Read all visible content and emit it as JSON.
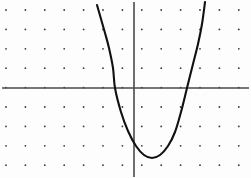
{
  "figure": {
    "background_color": "#fdfdfd",
    "width": 251,
    "height": 178
  },
  "grid": {
    "dot_color": "#3a3a3a",
    "dot_radius": 0.9,
    "spacing_px": 19.4,
    "origin_px": {
      "x": 134,
      "y": 88
    },
    "columns_px": [
      6,
      25.4,
      44.8,
      64.2,
      83.6,
      103,
      122.4,
      141.8,
      161.2,
      180.6,
      200,
      219.4,
      238.8
    ],
    "rows_px": [
      10,
      29.4,
      48.8,
      68.2,
      87.6,
      107,
      126.4,
      145.8,
      165.2
    ]
  },
  "axes": {
    "x_axis": {
      "label": "x-axis",
      "color": "#4a4a4a",
      "y_px": 88,
      "x_start_px": 2,
      "x_end_px": 249
    },
    "y_axis": {
      "label": "y-axis",
      "color": "#4a4a4a",
      "x_px": 134,
      "y_start_px": 2,
      "y_end_px": 177
    }
  },
  "chart_data": {
    "type": "line",
    "title": "",
    "xlabel": "",
    "ylabel": "",
    "curve_name": "parabola",
    "equation": "y = (x + 1)(x - 2.7)",
    "orientation": "opens upward",
    "stroke_color": "#111111",
    "grid_units": {
      "vertex": {
        "x": 0.93,
        "y": -3.6
      },
      "roots": [
        -0.98,
        2.73
      ],
      "leading_coefficient": 1.05,
      "xlim": [
        -6.8,
        6.0
      ],
      "ylim": [
        -4.6,
        4.5
      ]
    },
    "points_px": [
      {
        "x": 97,
        "y": 5
      },
      {
        "x": 101,
        "y": 19
      },
      {
        "x": 105,
        "y": 33
      },
      {
        "x": 109,
        "y": 48
      },
      {
        "x": 113,
        "y": 68
      },
      {
        "x": 115,
        "y": 88
      },
      {
        "x": 121,
        "y": 112
      },
      {
        "x": 128,
        "y": 131
      },
      {
        "x": 136,
        "y": 146
      },
      {
        "x": 144,
        "y": 155
      },
      {
        "x": 152,
        "y": 158
      },
      {
        "x": 160,
        "y": 155
      },
      {
        "x": 168,
        "y": 146
      },
      {
        "x": 175,
        "y": 132
      },
      {
        "x": 181,
        "y": 112
      },
      {
        "x": 187,
        "y": 88
      },
      {
        "x": 193,
        "y": 64
      },
      {
        "x": 198,
        "y": 44
      },
      {
        "x": 202,
        "y": 24
      },
      {
        "x": 205,
        "y": 2
      }
    ]
  }
}
